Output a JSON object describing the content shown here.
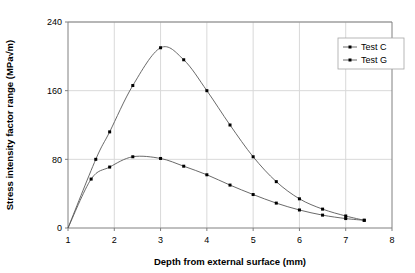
{
  "chart_data": {
    "type": "line",
    "title": "",
    "xlabel": "Depth from external surface (mm)",
    "ylabel": "Stress intensity factor range (MPa√m)",
    "xlim": [
      1,
      8
    ],
    "ylim": [
      0,
      240
    ],
    "xticks": [
      "1",
      "2",
      "3",
      "4",
      "5",
      "6",
      "7",
      "8"
    ],
    "yticks": [
      "0",
      "80",
      "160",
      "240"
    ],
    "grid": true,
    "legend_position": "top-right",
    "series": [
      {
        "name": "Test C",
        "marker": "square",
        "color": "#595959",
        "x": [
          1.0,
          1.6,
          1.9,
          2.4,
          3.0,
          3.5,
          4.0,
          4.5,
          5.0,
          5.5,
          6.0,
          6.5,
          7.0,
          7.4
        ],
        "y": [
          0,
          80,
          112,
          166,
          210,
          196,
          160,
          120,
          83,
          54,
          34,
          22,
          14,
          9
        ]
      },
      {
        "name": "Test G",
        "marker": "square",
        "color": "#595959",
        "x": [
          1.0,
          1.5,
          1.9,
          2.4,
          3.0,
          3.5,
          4.0,
          4.5,
          5.0,
          5.5,
          6.0,
          6.5,
          7.0,
          7.4
        ],
        "y": [
          0,
          57,
          71,
          83,
          81,
          72,
          62,
          50,
          39,
          29,
          21,
          15,
          11,
          9
        ]
      }
    ]
  },
  "legend": {
    "entries": [
      {
        "label": "Test C"
      },
      {
        "label": "Test G"
      }
    ]
  }
}
